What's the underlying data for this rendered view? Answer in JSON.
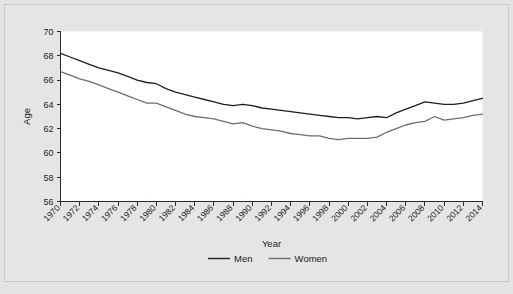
{
  "chart_data": {
    "type": "line",
    "title": "",
    "xlabel": "Year",
    "ylabel": "Age",
    "xlim": [
      1970,
      2014
    ],
    "ylim": [
      56,
      70
    ],
    "yticks": [
      56,
      58,
      60,
      62,
      64,
      66,
      68,
      70
    ],
    "xticks": [
      1970,
      1972,
      1974,
      1976,
      1978,
      1980,
      1982,
      1984,
      1986,
      1988,
      1990,
      1992,
      1994,
      1996,
      1998,
      2000,
      2002,
      2004,
      2006,
      2008,
      2010,
      2012,
      2014
    ],
    "grid": false,
    "legend_position": "bottom",
    "x": [
      1970,
      1971,
      1972,
      1973,
      1974,
      1975,
      1976,
      1977,
      1978,
      1979,
      1980,
      1981,
      1982,
      1983,
      1984,
      1985,
      1986,
      1987,
      1988,
      1989,
      1990,
      1991,
      1992,
      1993,
      1994,
      1995,
      1996,
      1997,
      1998,
      1999,
      2000,
      2001,
      2002,
      2003,
      2004,
      2005,
      2006,
      2007,
      2008,
      2009,
      2010,
      2011,
      2012,
      2013,
      2014
    ],
    "series": [
      {
        "name": "Men",
        "color": "#1f1f1f",
        "values": [
          68.2,
          67.9,
          67.6,
          67.3,
          67.0,
          66.8,
          66.6,
          66.3,
          66.0,
          65.8,
          65.7,
          65.3,
          65.0,
          64.8,
          64.6,
          64.4,
          64.2,
          64.0,
          63.9,
          64.0,
          63.9,
          63.7,
          63.6,
          63.5,
          63.4,
          63.3,
          63.2,
          63.1,
          63.0,
          62.9,
          62.9,
          62.8,
          62.9,
          63.0,
          62.9,
          63.3,
          63.6,
          63.9,
          64.2,
          64.1,
          64.0,
          64.0,
          64.1,
          64.3,
          64.5
        ]
      },
      {
        "name": "Women",
        "color": "#6e6e6e",
        "values": [
          66.7,
          66.4,
          66.1,
          65.9,
          65.6,
          65.3,
          65.0,
          64.7,
          64.4,
          64.1,
          64.1,
          63.8,
          63.5,
          63.2,
          63.0,
          62.9,
          62.8,
          62.6,
          62.4,
          62.5,
          62.2,
          62.0,
          61.9,
          61.8,
          61.6,
          61.5,
          61.4,
          61.4,
          61.2,
          61.1,
          61.2,
          61.2,
          61.2,
          61.3,
          61.7,
          62.0,
          62.3,
          62.5,
          62.6,
          63.0,
          62.7,
          62.8,
          62.9,
          63.1,
          63.2
        ]
      }
    ]
  },
  "legend": {
    "items": [
      {
        "label": "Men",
        "color": "#1f1f1f"
      },
      {
        "label": "Women",
        "color": "#6e6e6e"
      }
    ]
  },
  "axes": {
    "x_title": "Year",
    "y_title": "Age"
  }
}
